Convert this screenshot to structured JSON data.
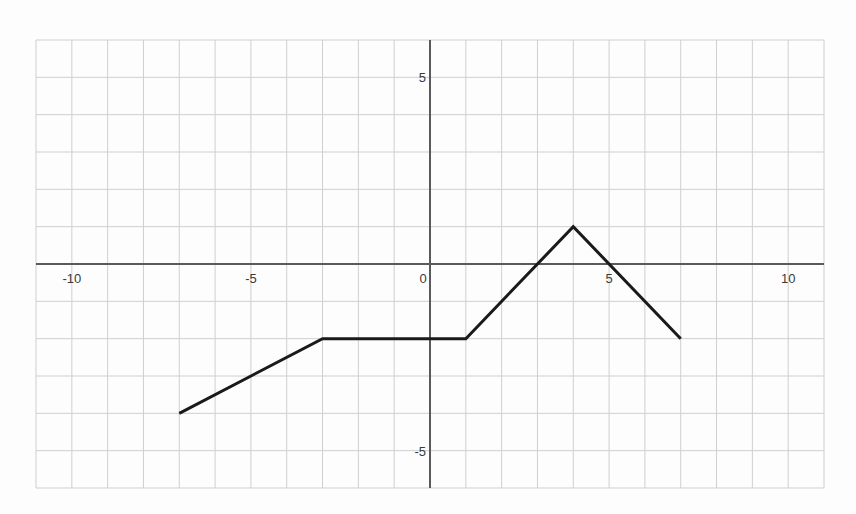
{
  "chart_data": {
    "type": "line",
    "title": "",
    "xlabel": "",
    "ylabel": "",
    "xlim": [
      -11,
      11
    ],
    "ylim": [
      -6,
      6
    ],
    "grid": true,
    "grid_step": 1,
    "x_ticks": [
      {
        "value": -10,
        "label": "-10"
      },
      {
        "value": -5,
        "label": "-5"
      },
      {
        "value": 0,
        "label": "0"
      },
      {
        "value": 5,
        "label": "5"
      },
      {
        "value": 10,
        "label": "10"
      }
    ],
    "y_ticks": [
      {
        "value": 5,
        "label": "5"
      },
      {
        "value": -5,
        "label": "-5"
      }
    ],
    "series": [
      {
        "name": "piecewise-linear-function",
        "color": "#1a1a1a",
        "x": [
          -7,
          -3,
          1,
          4,
          7
        ],
        "y": [
          -4,
          -2,
          -2,
          1,
          -2
        ]
      }
    ],
    "legend": null
  },
  "layout": {
    "plot_left": 36,
    "plot_right": 824,
    "plot_top": 40,
    "plot_bottom": 488,
    "colors": {
      "grid": "#cfcfcf",
      "axis": "#5a5a5a",
      "line": "#1a1a1a",
      "background": "#fdfdfd"
    }
  }
}
